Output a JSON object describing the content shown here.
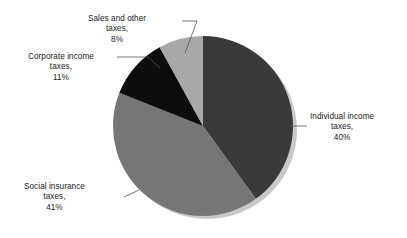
{
  "chart_data": {
    "type": "pie",
    "title": "",
    "subtitle": "",
    "xlabel": "",
    "ylabel": "",
    "legend_position": "none",
    "grid": false,
    "labels_show_percent": true,
    "start_angle_deg": 0,
    "direction": "clockwise",
    "categories": [
      "Individual income taxes",
      "Social insurance taxes",
      "Corporate income taxes",
      "Sales and other taxes"
    ],
    "values": [
      40,
      41,
      11,
      8
    ],
    "slices": [
      {
        "name": "Individual income taxes",
        "label_name": "Individual income",
        "label_name2": "taxes,",
        "percent_text": "40%",
        "value": 40,
        "color": "#3a3a3a",
        "start_deg": 0,
        "end_deg": 144
      },
      {
        "name": "Social insurance taxes",
        "label_name": "Social insurance",
        "label_name2": "taxes,",
        "percent_text": "41%",
        "value": 41,
        "color": "#767676",
        "start_deg": 144,
        "end_deg": 291.6
      },
      {
        "name": "Corporate income taxes",
        "label_name": "Corporate income",
        "label_name2": "taxes,",
        "percent_text": "11%",
        "value": 11,
        "color": "#0d0d0d",
        "start_deg": 291.6,
        "end_deg": 331.2
      },
      {
        "name": "Sales and other taxes",
        "label_name": "Sales and other",
        "label_name2": "taxes,",
        "percent_text": "8%",
        "value": 8,
        "color": "#a8a8a8",
        "start_deg": 331.2,
        "end_deg": 360
      }
    ],
    "colors": {
      "individual": "#3a3a3a",
      "social": "#767676",
      "corporate": "#0d0d0d",
      "sales": "#a8a8a8",
      "background": "#ffffff",
      "text": "#1a1a1a",
      "leader_line": "#555555",
      "shadow": "#c9c9c9"
    }
  }
}
